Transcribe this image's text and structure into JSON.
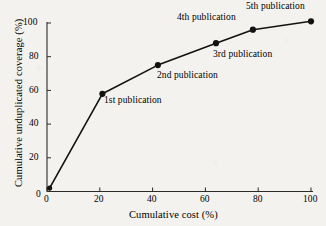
{
  "chart_data": {
    "type": "line",
    "title": "",
    "xlabel": "Cumulative cost (%)",
    "ylabel": "Cumulative unduplicated coverage (%)",
    "xlim": [
      0,
      100
    ],
    "ylim": [
      0,
      100
    ],
    "xticks": [
      "0",
      "20",
      "40",
      "60",
      "80",
      "100"
    ],
    "xtick_values": [
      0,
      20,
      40,
      60,
      80,
      100
    ],
    "yticks": [
      "0",
      "20",
      "40",
      "60",
      "80",
      "100"
    ],
    "ytick_values": [
      0,
      20,
      40,
      60,
      80,
      100
    ],
    "grid": false,
    "legend": "none",
    "series": [
      {
        "name": "Cumulative unduplicated coverage",
        "marker": "filled-circle",
        "x": [
          1,
          21,
          42,
          64,
          78,
          100
        ],
        "y": [
          2,
          58,
          75,
          88,
          96,
          101
        ]
      }
    ],
    "annotations": [
      {
        "label": "1st publication",
        "x": 21,
        "y": 58
      },
      {
        "label": "2nd publication",
        "x": 42,
        "y": 75
      },
      {
        "label": "3rd publication",
        "x": 64,
        "y": 88
      },
      {
        "label": "4th publication",
        "x": 78,
        "y": 96
      },
      {
        "label": "5th publication",
        "x": 100,
        "y": 101
      }
    ]
  },
  "axis": {
    "x_title": "Cumulative cost (%)",
    "y_title": "Cumulative unduplicated coverage (%)",
    "x_tick_labels": [
      "0",
      "20",
      "40",
      "60",
      "80",
      "100"
    ],
    "y_tick_labels": [
      "0",
      "20",
      "40",
      "60",
      "80",
      "100"
    ]
  },
  "annotations": {
    "p1": "1st publication",
    "p2": "2nd publication",
    "p3": "3rd publication",
    "p4": "4th publication",
    "p5": "5th publication"
  },
  "colors": {
    "background": "#f4f2ee",
    "ink": "#121212",
    "axis": "#2b2b2b"
  }
}
